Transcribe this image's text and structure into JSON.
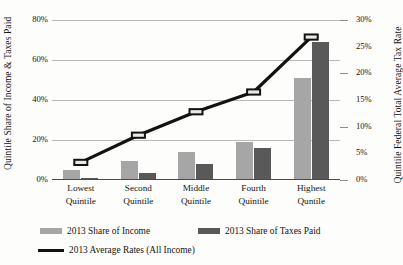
{
  "chart_data": {
    "type": "bar",
    "title": "",
    "categories": [
      "Lowest Quintile",
      "Second Quintile",
      "Middle Quintile",
      "Fourth Quintile",
      "Highest Quntile"
    ],
    "category_lines": [
      [
        "Lowest",
        "Quintile"
      ],
      [
        "Second",
        "Quintile"
      ],
      [
        "Middle",
        "Quintile"
      ],
      [
        "Fourth",
        "Quintile"
      ],
      [
        "Highest",
        "Quntile"
      ]
    ],
    "series": [
      {
        "name": "2013 Share of Income",
        "type": "bar",
        "axis": "left",
        "color": "#a6a6a6",
        "values": [
          5,
          9.5,
          14,
          19,
          51
        ]
      },
      {
        "name": "2013 Share of Taxes Paid",
        "type": "bar",
        "axis": "left",
        "color": "#595959",
        "values": [
          0.8,
          3.5,
          8,
          16,
          69
        ]
      },
      {
        "name": "2013 Average Rates (All Income)",
        "type": "line",
        "axis": "right",
        "color": "#121212",
        "values": [
          3.3,
          8.4,
          12.8,
          16.5,
          26.8
        ]
      }
    ],
    "xlabel": "",
    "ylabel": "Quintile Share of Income & Taxes Paid",
    "y2label": "Quintile Federal Total Average Tax Rate",
    "ylim": [
      0,
      80
    ],
    "y2lim": [
      0,
      30
    ],
    "yticks": [
      "0%",
      "20%",
      "40%",
      "60%",
      "80%"
    ],
    "ytick_values": [
      0,
      20,
      40,
      60,
      80
    ],
    "y2ticks": [
      "0%",
      "5%",
      "10%",
      "15%",
      "20%",
      "25%",
      "30%"
    ],
    "y2tick_values": [
      0,
      5,
      10,
      15,
      20,
      25,
      30
    ],
    "grid": true,
    "legend_position": "bottom"
  },
  "legend": {
    "income_label": "2013 Share of Income",
    "taxes_label": "2013 Share of Taxes Paid",
    "rates_label": "2013 Average Rates (All Income)"
  }
}
